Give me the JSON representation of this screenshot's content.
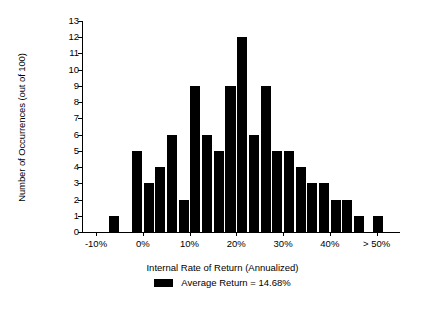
{
  "chart_data": {
    "type": "bar",
    "title": "",
    "xlabel": "Internal Rate of Return (Annualized)",
    "ylabel": "Number of Occurrences (out of 100)",
    "ylim": [
      0,
      13
    ],
    "ytick_labels": [
      "0",
      "1",
      "2",
      "3",
      "4",
      "5",
      "6",
      "7",
      "8",
      "9",
      "10",
      "11",
      "12",
      "13"
    ],
    "ytick_values": [
      0,
      1,
      2,
      3,
      4,
      5,
      6,
      7,
      8,
      9,
      10,
      11,
      12,
      13
    ],
    "xtick_labels": [
      "-10%",
      "0%",
      "10%",
      "20%",
      "30%",
      "40%",
      "> 50%"
    ],
    "xtick_values": [
      -10,
      0,
      10,
      20,
      30,
      40,
      50
    ],
    "xlim": [
      -13,
      55
    ],
    "grid": false,
    "bar_color": "#000000",
    "bin_width": 2.5,
    "categories": [
      "-12.5%",
      "-10%",
      "-7.5%",
      "-5%",
      "-2.5%",
      "0%",
      "2.5%",
      "5%",
      "7.5%",
      "10%",
      "12.5%",
      "15%",
      "17.5%",
      "20%",
      "22.5%",
      "25%",
      "27.5%",
      "30%",
      "32.5%",
      "35%",
      "37.5%",
      "40%",
      "42.5%",
      "45%",
      "> 50%"
    ],
    "values": [
      0,
      0,
      1,
      0,
      5,
      3,
      4,
      6,
      2,
      9,
      6,
      5,
      9,
      12,
      6,
      9,
      5,
      5,
      4,
      3,
      3,
      2,
      2,
      1,
      1
    ],
    "legend": {
      "position": "bottom",
      "entries": [
        {
          "label": "Average Return = 14.68%",
          "color": "#000000"
        }
      ]
    },
    "annotations": {
      "average_return": "14.68%"
    }
  },
  "axis": {
    "y_title": "Number of Occurrences (out of 100)",
    "x_title": "Internal Rate of Return (Annualized)"
  },
  "legend": {
    "average_return_label": "Average Return = 14.68%"
  }
}
